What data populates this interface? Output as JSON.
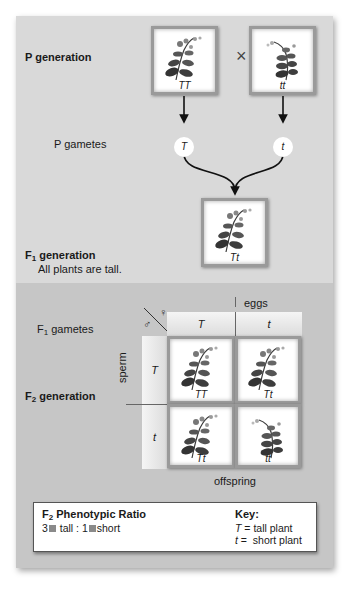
{
  "p_generation": {
    "label": "P generation",
    "cross_symbol": "×",
    "parent1_genotype": "TT",
    "parent2_genotype": "tt",
    "gametes_label": "P gametes",
    "gamete1": "T",
    "gamete2": "t"
  },
  "f1_generation": {
    "label_prefix": "F",
    "label_sub": "1",
    "label_suffix": " generation",
    "description": "All plants are tall.",
    "genotype": "Tt"
  },
  "punnett": {
    "gametes_label_prefix": "F",
    "gametes_label_sub": "1",
    "gametes_label_suffix": " gametes",
    "female_symbol": "♀",
    "male_symbol": "♂",
    "eggs_label": "eggs",
    "sperm_label": "sperm",
    "offspring_label": "offspring",
    "egg_alleles": [
      "T",
      "t"
    ],
    "sperm_alleles": [
      "T",
      "t"
    ],
    "cells": [
      [
        "TT",
        "Tt"
      ],
      [
        "Tt",
        "tt"
      ]
    ],
    "f2_label_prefix": "F",
    "f2_label_sub": "2",
    "f2_label_suffix": " generation"
  },
  "summary": {
    "title_prefix": "F",
    "title_sub": "2",
    "title_suffix": " Phenotypic Ratio",
    "ratio_tall_count": "3",
    "ratio_tall_label": " tall : ",
    "ratio_short_count": "1",
    "ratio_short_label": "short",
    "square_color": "#8a8a8a",
    "key_title": "Key:",
    "key_items": [
      {
        "symbol": "T",
        "eq": " = ",
        "meaning": "tall plant"
      },
      {
        "symbol": "t",
        "eq": " =  ",
        "meaning": "short plant"
      }
    ]
  }
}
